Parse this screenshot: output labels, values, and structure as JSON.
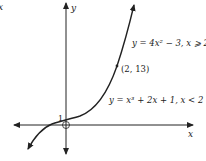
{
  "diagram": {
    "type": "piecewise function graph",
    "axes": {
      "x_label": "x",
      "y_label": "y"
    },
    "corner_fragment": "x",
    "intercept_label": "1",
    "point_label": "(2, 13)",
    "upper_piece_label": "y = 4x² − 3,  x ⩾ 2",
    "lower_piece_label": "y = x³ + 2x + 1,  x < 2",
    "pieces": [
      {
        "equation": "y = x^3 + 2x + 1",
        "domain": "x < 2"
      },
      {
        "equation": "y = 4x^2 - 3",
        "domain": "x >= 2"
      }
    ],
    "marked_points": [
      {
        "x": 0,
        "y": 1,
        "label": "1"
      },
      {
        "x": 2,
        "y": 13,
        "label": "(2, 13)"
      }
    ],
    "colors": {
      "ink": "#222222",
      "background": "#ffffff"
    }
  }
}
